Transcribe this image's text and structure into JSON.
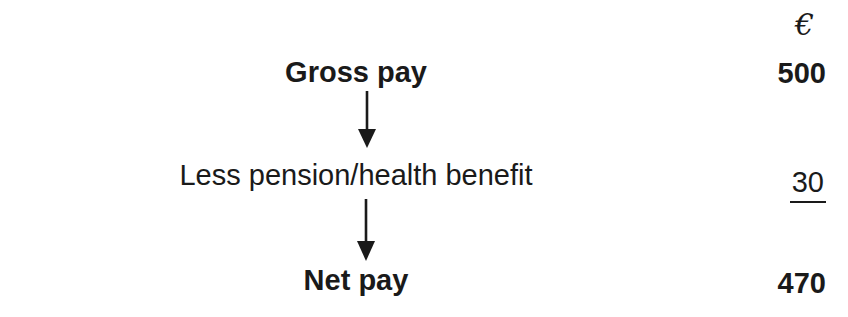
{
  "page": {
    "background": "#ffffff",
    "ink_color": "#1a1a1a"
  },
  "diagram": {
    "currency_header": "€",
    "steps": [
      {
        "label": "Gross pay",
        "value": "500",
        "style": "bold"
      },
      {
        "label": "Less pension/health benefit",
        "value": "30",
        "style": "underlined"
      },
      {
        "label": "Net pay",
        "value": "470",
        "style": "bold"
      }
    ]
  }
}
